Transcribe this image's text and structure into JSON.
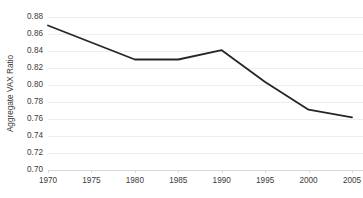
{
  "chart_data": {
    "type": "line",
    "title": "",
    "subtitle": "",
    "xlabel": "",
    "ylabel": "Aggregate VAX Ratio",
    "x": [
      1970,
      1975,
      1980,
      1985,
      1990,
      1995,
      2000,
      2005
    ],
    "categories": [
      "1970",
      "1975",
      "1980",
      "1985",
      "1990",
      "1995",
      "2000",
      "2005"
    ],
    "values": [
      0.87,
      0.85,
      0.83,
      0.83,
      0.841,
      0.8035,
      0.771,
      0.762
    ],
    "series": [
      {
        "name": "Aggregate VAX Ratio",
        "values": [
          0.87,
          0.85,
          0.83,
          0.83,
          0.841,
          0.8035,
          0.771,
          0.762
        ]
      }
    ],
    "xlim": [
      1970,
      2005
    ],
    "ylim": [
      0.7,
      0.88
    ],
    "ytick_labels": [
      "0.88",
      "0.86",
      "0.84",
      "0.82",
      "0.80",
      "0.78",
      "0.76",
      "0.74",
      "0.72",
      "0.70"
    ],
    "ytick_values": [
      0.88,
      0.86,
      0.84,
      0.82,
      0.8,
      0.78,
      0.76,
      0.74,
      0.72,
      0.7
    ],
    "xtick_labels": [
      "1970",
      "1975",
      "1980",
      "1985",
      "1990",
      "1995",
      "2000",
      "2005"
    ],
    "grid": "horizontal",
    "legend": "none",
    "annotations": [],
    "colors": {
      "line": "#262626",
      "grid": "#eeeeee",
      "axis": "#d9d9d9",
      "text": "#3b3b3b",
      "background": "#ffffff"
    }
  }
}
